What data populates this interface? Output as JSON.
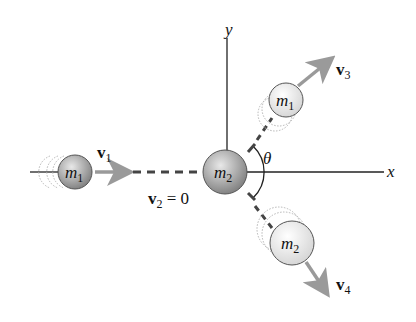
{
  "diagram": {
    "axes": {
      "x_label": "x",
      "y_label": "y"
    },
    "angle_label": "θ",
    "before": {
      "m1": {
        "label_base": "m",
        "label_sub": "1"
      },
      "v1": {
        "label_base": "v",
        "label_sub": "1"
      },
      "m2": {
        "label_base": "m",
        "label_sub": "2"
      },
      "v2": {
        "label_base": "v",
        "label_sub": "2",
        "equals": " = 0"
      }
    },
    "after": {
      "m1": {
        "label_base": "m",
        "label_sub": "1"
      },
      "v3": {
        "label_base": "v",
        "label_sub": "3"
      },
      "m2": {
        "label_base": "m",
        "label_sub": "2"
      },
      "v4": {
        "label_base": "v",
        "label_sub": "4"
      }
    },
    "colors": {
      "axis": "#222222",
      "arrow": "#9a9a9a",
      "dash": "#444444",
      "ball_dark": "#8a8a8a",
      "ball_light": "#f2f2f2",
      "ghost": "#b5b5b5"
    }
  }
}
